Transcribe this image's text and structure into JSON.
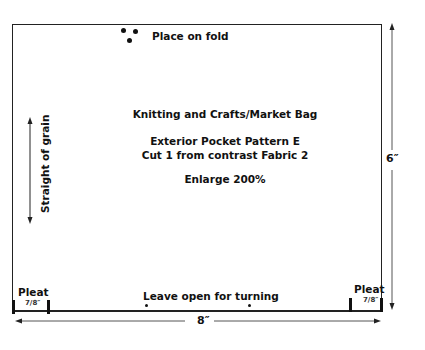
{
  "pattern": {
    "fold_label": "Place on fold",
    "title": "Knitting and Crafts/Market Bag",
    "piece_name": "Exterior Pocket Pattern E",
    "cut_instruction": "Cut 1 from contrast Fabric 2",
    "enlarge": "Enlarge 200%",
    "grain_label": "Straight of grain",
    "opening_label": "Leave open for turning",
    "pleats": [
      {
        "label": "Pleat",
        "size": "7/8″",
        "position": "left"
      },
      {
        "label": "Pleat",
        "size": "7/8″",
        "position": "right"
      }
    ],
    "dimensions": {
      "width": "8″",
      "height": "6″"
    }
  },
  "colors": {
    "line": "#222222",
    "text": "#111111",
    "background": "#ffffff"
  }
}
